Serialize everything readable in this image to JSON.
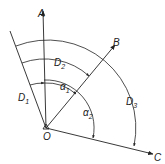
{
  "diagram": {
    "origin_label": "O",
    "rays": [
      {
        "id": "A",
        "label": "A"
      },
      {
        "id": "B",
        "label": "B"
      },
      {
        "id": "C",
        "label": "C"
      }
    ],
    "distances": [
      {
        "label": "D",
        "sub": "1"
      },
      {
        "label": "D",
        "sub": "2"
      },
      {
        "label": "D",
        "sub": "3"
      }
    ],
    "angles": [
      {
        "label": "α",
        "sub": "1"
      },
      {
        "label": "α",
        "sub": "2"
      }
    ],
    "colors": {
      "line": "#222222",
      "background": "#ffffff"
    }
  }
}
